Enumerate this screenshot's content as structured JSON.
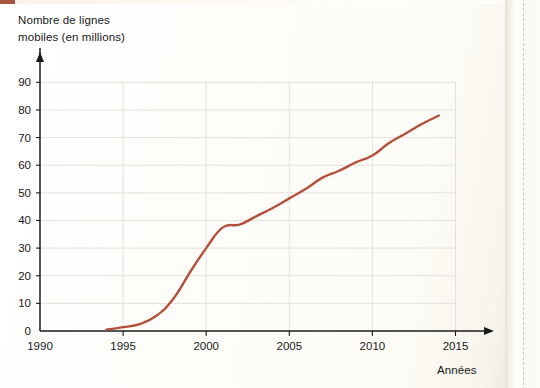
{
  "figure": {
    "y_axis_title_line1": "Nombre de lignes",
    "y_axis_title_line2": "mobiles (en millions)",
    "x_axis_title": "Années",
    "line_color": "#b4503b",
    "axis_color": "#1b1b1b",
    "grid_color": "#e3e1dc",
    "paper_color": "#fdfcf8"
  },
  "chart_data": {
    "type": "line",
    "title": "",
    "subtitle": "",
    "xlabel": "Années",
    "ylabel": "Nombre de lignes mobiles (en millions)",
    "xlim": [
      1990,
      2016
    ],
    "ylim": [
      0,
      95
    ],
    "xticks": [
      1990,
      1995,
      2000,
      2005,
      2010,
      2015
    ],
    "xtick_labels": [
      "1990",
      "1995",
      "2000",
      "2005",
      "2010",
      "2015"
    ],
    "yticks": [
      0,
      10,
      20,
      30,
      40,
      50,
      60,
      70,
      80,
      90
    ],
    "ytick_labels": [
      "0",
      "10",
      "20",
      "30",
      "40",
      "50",
      "60",
      "70",
      "80",
      "90"
    ],
    "grid": "horizontal-and-vertical",
    "legend": "none",
    "series": [
      {
        "name": "Nombre de lignes mobiles (en millions)",
        "color": "#b4503b",
        "x": [
          1994,
          1995,
          1996,
          1997,
          1998,
          1999,
          2000,
          2001,
          2002,
          2003,
          2004,
          2005,
          2006,
          2007,
          2008,
          2009,
          2010,
          2011,
          2012,
          2013,
          2014
        ],
        "values": [
          0.5,
          1.4,
          2.5,
          5.5,
          11.5,
          21,
          30,
          37.5,
          38.5,
          41.5,
          44.5,
          48,
          51.5,
          55.5,
          58,
          61,
          63.5,
          68,
          71.5,
          75,
          78
        ]
      }
    ],
    "annotations": []
  }
}
